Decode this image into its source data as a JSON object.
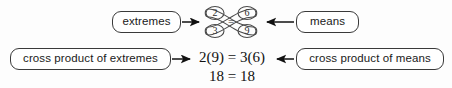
{
  "diagram": {
    "colors": {
      "background": "#fdfdfd",
      "box_border": "#3a3a3a",
      "box_fill": "#ffffff",
      "text": "#1a1a1a",
      "arrow": "#111111",
      "loop_stroke": "#4a4a4a"
    },
    "callouts": {
      "extremes": "extremes",
      "means": "means",
      "cross_product_of_extremes": "cross product of extremes",
      "cross_product_of_means": "cross product of means"
    },
    "proportion": {
      "numerator_left": "2",
      "numerator_right": "6",
      "denominator_left": "3",
      "denominator_right": "9",
      "relation": "="
    },
    "equations": {
      "primary": "2(9) = 3(6)",
      "result": "18 = 18"
    },
    "arrows": {
      "extremes_arrow": "arrow-right",
      "means_arrow": "arrow-left",
      "cross_extremes_arrow": "arrow-right",
      "cross_means_arrow": "arrow-left"
    }
  }
}
